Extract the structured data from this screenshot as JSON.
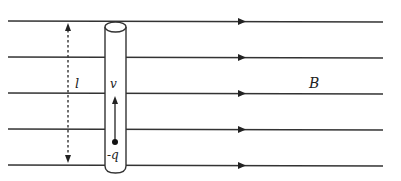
{
  "diagram": {
    "field_label": "B",
    "length_label": "l",
    "velocity_label": "v",
    "charge_label": "-q",
    "field_line_count": 5,
    "field_direction": "right",
    "velocity_direction": "up",
    "colors": {
      "line": "#333333",
      "background": "#ffffff"
    }
  }
}
